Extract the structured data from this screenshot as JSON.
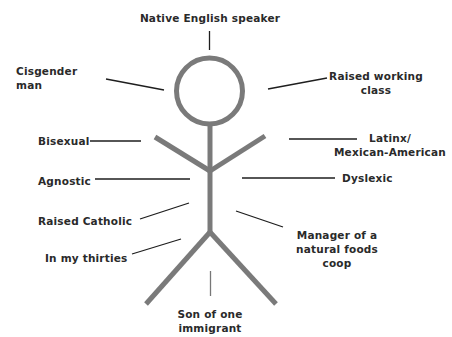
{
  "diagram": {
    "type": "identity-stick-figure",
    "figure_color": "#7a7a7a",
    "line_color": "#1e1e1e",
    "text_color": "#2a2a2a",
    "labels": {
      "native_english": "Native English speaker",
      "cisgender": "Cisgender man",
      "working_class": "Raised working\nclass",
      "bisexual": "Bisexual",
      "latinx": "Latinx/\nMexican-American",
      "agnostic": "Agnostic",
      "dyslexic": "Dyslexic",
      "catholic": "Raised Catholic",
      "manager": "Manager of a\nnatural foods\ncoop",
      "thirties": "In my thirties",
      "immigrant": "Son of one immigrant"
    }
  }
}
